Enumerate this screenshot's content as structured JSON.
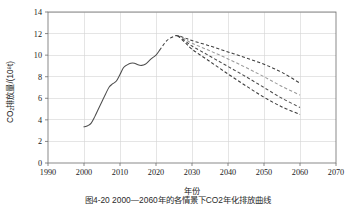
{
  "figure": {
    "caption": "图4-20  2000—2060年的各情景下CO2年化排放曲线"
  },
  "chart_data": {
    "type": "line",
    "title": "",
    "xlabel": "年份",
    "ylabel": "CO₂排放量/(10⁸t)",
    "xlim": [
      1990,
      2070
    ],
    "ylim": [
      0,
      14
    ],
    "xticks": [
      1990,
      2000,
      2010,
      2020,
      2030,
      2040,
      2050,
      2060,
      2070
    ],
    "yticks": [
      0,
      2,
      4,
      6,
      8,
      10,
      12,
      14
    ],
    "grid": true,
    "legend": "none",
    "colors": {
      "historical": "#4d4d4d",
      "scenario_high": "#3f3f3f",
      "scenario_mid_high": "#9a9a9a",
      "scenario_mid_low": "#4a4a4a",
      "scenario_low": "#3a3a3a"
    },
    "series": [
      {
        "name": "历史排放",
        "style": "solid",
        "color": "#4d4d4d",
        "x": [
          2000,
          2001,
          2002,
          2003,
          2004,
          2005,
          2006,
          2007,
          2008,
          2009,
          2010,
          2011,
          2012,
          2013,
          2014,
          2015,
          2016,
          2017,
          2018,
          2019,
          2020,
          2021
        ],
        "values": [
          3.35,
          3.45,
          3.7,
          4.3,
          5.0,
          5.7,
          6.4,
          7.05,
          7.35,
          7.6,
          8.2,
          8.85,
          9.1,
          9.25,
          9.25,
          9.1,
          9.05,
          9.15,
          9.45,
          9.75,
          10.0,
          10.45
        ]
      },
      {
        "name": "情景1高位峰值",
        "style": "dashed",
        "color": "#3f3f3f",
        "x": [
          2021,
          2023,
          2025,
          2026,
          2028,
          2030,
          2035,
          2040,
          2045,
          2050,
          2055,
          2060
        ],
        "values": [
          10.45,
          11.35,
          11.75,
          11.8,
          11.6,
          11.35,
          10.85,
          10.3,
          9.75,
          9.15,
          8.4,
          7.4
        ]
      },
      {
        "name": "情景2中高位",
        "style": "dashed",
        "color": "#9a9a9a",
        "x": [
          2026,
          2028,
          2030,
          2035,
          2040,
          2045,
          2050,
          2055,
          2060
        ],
        "values": [
          11.8,
          11.5,
          11.1,
          10.4,
          9.65,
          8.85,
          8.0,
          7.1,
          6.3
        ]
      },
      {
        "name": "情景3中低位",
        "style": "dashed",
        "color": "#4a4a4a",
        "x": [
          2026,
          2028,
          2030,
          2035,
          2040,
          2045,
          2050,
          2055,
          2060
        ],
        "values": [
          11.8,
          11.35,
          10.85,
          9.9,
          8.95,
          8.0,
          7.0,
          6.0,
          5.15
        ]
      },
      {
        "name": "情景4低位",
        "style": "dashed",
        "color": "#3a3a3a",
        "x": [
          2026,
          2028,
          2030,
          2035,
          2040,
          2045,
          2050,
          2055,
          2060
        ],
        "values": [
          11.8,
          11.2,
          10.55,
          9.4,
          8.25,
          7.15,
          6.1,
          5.2,
          4.5
        ]
      }
    ]
  }
}
